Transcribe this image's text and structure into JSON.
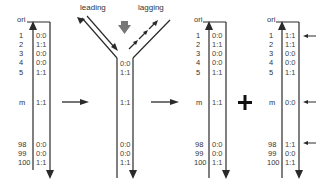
{
  "fork_labels": {
    "leading": "leading",
    "lagging": "lagging"
  },
  "ori_label": "ori",
  "operator": "+",
  "rows": [
    "1",
    "2",
    "3",
    "4",
    "5",
    "m",
    "98",
    "99",
    "100"
  ],
  "strands": [
    {
      "id": "parent",
      "values": [
        "0:0",
        "1:1",
        "0:0",
        "0:0",
        "1:1",
        "1:1",
        "0:0",
        "0:0",
        "1:1"
      ]
    },
    {
      "id": "fork",
      "values": [
        "0:0",
        "1:1",
        "1:1",
        "0:0",
        "0:0",
        "1:1"
      ],
      "visible_rows": [
        "1",
        "2",
        "m",
        "98",
        "99",
        "100"
      ]
    },
    {
      "id": "daughter-1",
      "values": [
        "0:0",
        "1:1",
        "0:0",
        "0:0",
        "1:1",
        "1:1",
        "0:0",
        "0:0",
        "1:1"
      ]
    },
    {
      "id": "daughter-2",
      "values": [
        "1:1",
        "1:1",
        "0:0",
        "0:0",
        "1:1",
        "0:0",
        "1:1",
        "0:0",
        "1:1"
      ],
      "marked_rows": [
        "1",
        "m",
        "98"
      ]
    }
  ],
  "colors": {
    "line": "#2a2a2a",
    "text": "#333333",
    "gray_arrow": "#777777"
  }
}
